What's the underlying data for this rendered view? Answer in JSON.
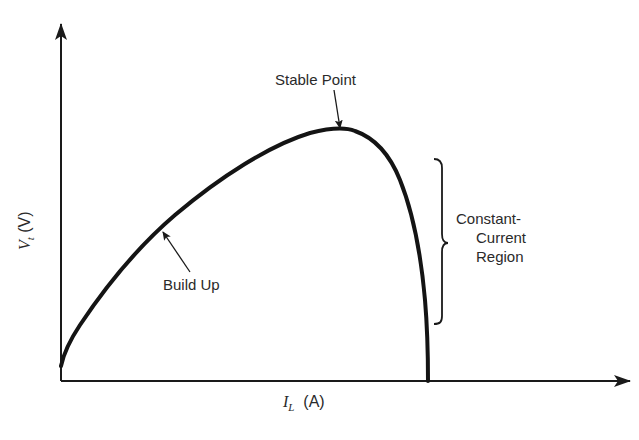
{
  "diagram": {
    "y_axis": {
      "symbol": "V",
      "subscript": "t",
      "unit": "(V)"
    },
    "x_axis": {
      "symbol": "I",
      "subscript": "L",
      "unit": "(A)"
    },
    "annotations": {
      "stable_point": "Stable Point",
      "build_up": "Build Up",
      "region_line1": "Constant-",
      "region_line2": "Current",
      "region_line3": "Region"
    },
    "colors": {
      "ink": "#1a1a1a",
      "text": "#2a2a2a",
      "background": "#ffffff"
    }
  }
}
